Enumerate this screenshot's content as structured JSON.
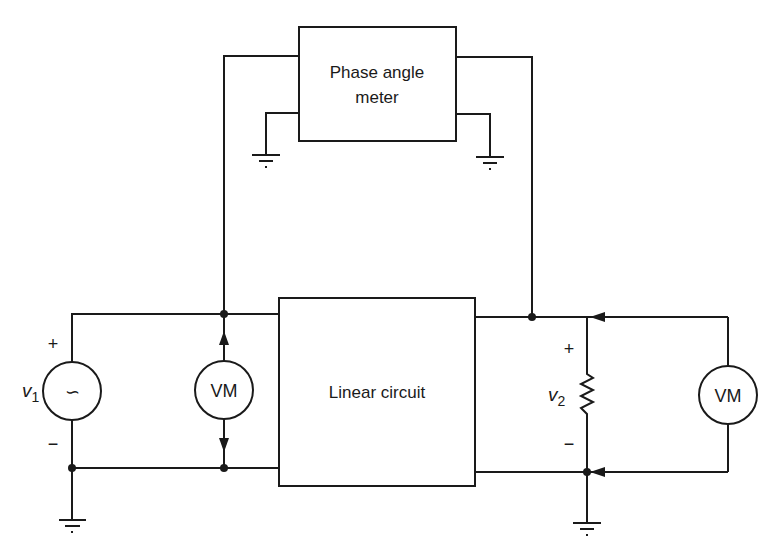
{
  "diagram": {
    "type": "circuit",
    "phase_meter": {
      "line1": "Phase angle",
      "line2": "meter"
    },
    "linear_circuit": {
      "label": "Linear circuit"
    },
    "source": {
      "name": "v",
      "subscript": "1",
      "plus": "+",
      "minus": "−",
      "symbol": "∽"
    },
    "voltmeter_left": {
      "label": "VM"
    },
    "voltmeter_right": {
      "label": "VM"
    },
    "load": {
      "name": "v",
      "subscript": "2",
      "plus": "+",
      "minus": "−"
    }
  }
}
